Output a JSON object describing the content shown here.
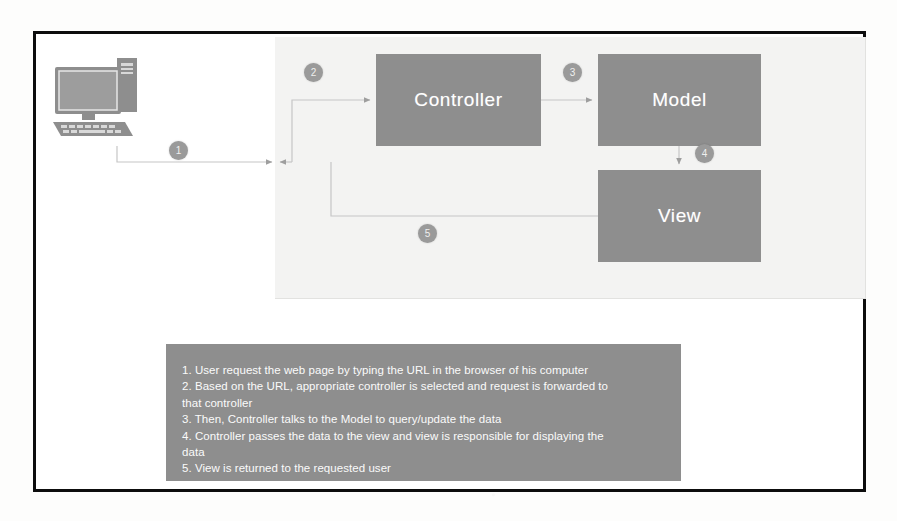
{
  "diagram": {
    "colors": {
      "frame_border": "#0d0d0d",
      "panel_background": "#f3f3f2",
      "node_fill": "#8e8e8e",
      "node_text": "#ffffff",
      "connector": "#b9b9b9",
      "step_badge": "#9a9a9a",
      "legend_background": "#8e8e8e",
      "legend_text": "#fbfbfb"
    },
    "actor": {
      "name": "user-computer",
      "icon": "desktop-computer-icon"
    },
    "nodes": [
      {
        "id": "controller",
        "label": "Controller"
      },
      {
        "id": "model",
        "label": "Model"
      },
      {
        "id": "view",
        "label": "View"
      }
    ],
    "steps": [
      {
        "number": "1",
        "from": "user-computer",
        "to": "application"
      },
      {
        "number": "2",
        "from": "application",
        "to": "controller"
      },
      {
        "number": "3",
        "from": "controller",
        "to": "model"
      },
      {
        "number": "4",
        "from": "model",
        "to": "view"
      },
      {
        "number": "5",
        "from": "view",
        "to": "user-computer"
      }
    ],
    "legend": {
      "lines": [
        "1. User request the web page by typing the URL in the browser of his computer",
        "2. Based on the URL, appropriate controller is selected and request is forwarded to",
        "that controller",
        "3. Then, Controller talks to the Model to query/update the data",
        "4. Controller passes the data to the view and view is responsible for displaying the",
        "data",
        "5. View is returned to the requested user"
      ]
    }
  }
}
